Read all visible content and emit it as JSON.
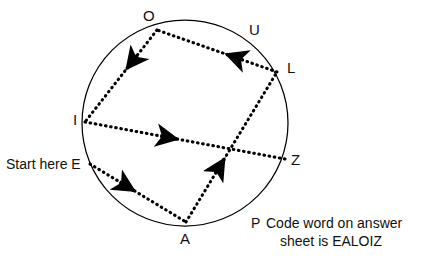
{
  "diagram": {
    "type": "circle-with-directed-path",
    "background_color": "#ffffff",
    "stroke_color": "#000000",
    "circle": {
      "cx": 185,
      "cy": 123,
      "r": 103
    },
    "nodes": [
      {
        "id": "O",
        "label": "O",
        "x": 157,
        "y": 30,
        "label_x": 143,
        "label_y": 8
      },
      {
        "id": "U",
        "label": "U",
        "x": 246,
        "y": 45,
        "label_x": 249,
        "label_y": 22
      },
      {
        "id": "L",
        "label": "L",
        "x": 277,
        "y": 72,
        "label_x": 287,
        "label_y": 60
      },
      {
        "id": "Z",
        "label": "Z",
        "x": 285,
        "y": 159,
        "label_x": 291,
        "label_y": 152
      },
      {
        "id": "P",
        "label": "P",
        "x": 256,
        "y": 209,
        "label_x": 251,
        "label_y": 215
      },
      {
        "id": "A",
        "label": "A",
        "x": 186,
        "y": 222,
        "label_x": 180,
        "label_y": 231
      },
      {
        "id": "E",
        "label": "E",
        "x": 90,
        "y": 164,
        "label_x": 72,
        "label_y": 156
      },
      {
        "id": "I",
        "label": "I",
        "x": 85,
        "y": 122,
        "label_x": 73,
        "label_y": 112
      }
    ],
    "edges": [
      {
        "from": "E",
        "to": "A",
        "arrow_t": 0.46,
        "style": "dotted"
      },
      {
        "from": "A",
        "to": "L",
        "arrow_t": 0.42,
        "style": "dotted"
      },
      {
        "from": "L",
        "to": "O",
        "arrow_t": 0.42,
        "style": "dotted"
      },
      {
        "from": "O",
        "to": "I",
        "arrow_t": 0.42,
        "style": "dotted"
      },
      {
        "from": "I",
        "to": "Z",
        "arrow_t": 0.46,
        "style": "dotted"
      }
    ],
    "path_order": "E-A-L-O-I-Z"
  },
  "labels": {
    "O": "O",
    "U": "U",
    "L": "L",
    "Z": "Z",
    "P": "P",
    "A": "A",
    "E": "E",
    "I": "I"
  },
  "annotations": {
    "start_here": "Start here E",
    "code_word_line1": "Code word on answer",
    "code_word_line2": "sheet is EALOIZ",
    "code_word_marker": "P",
    "code_word_full": "P Code word on answer sheet is EALOIZ"
  }
}
